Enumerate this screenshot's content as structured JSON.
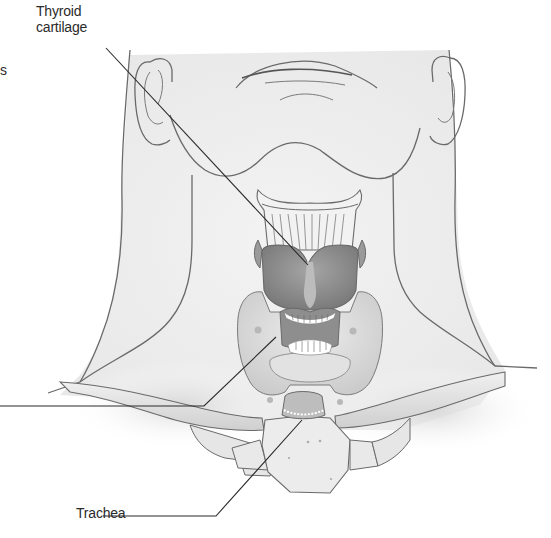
{
  "figure": {
    "labels": {
      "thyroid_cartilage_line1": "Thyroid",
      "thyroid_cartilage_line2": "cartilage",
      "trachea": "Trachea",
      "cropped_left_fragment": "s"
    },
    "leader_lines": [
      {
        "label": "Thyroid cartilage",
        "from": [
          118,
          45
        ],
        "to": [
          308,
          263
        ]
      },
      {
        "label": "(cropped, left edge) thyroid gland",
        "from": [
          0,
          406
        ],
        "to": [
          204,
          406
        ],
        "bend_to": [
          276,
          337
        ]
      },
      {
        "label": "Trachea",
        "from": [
          103,
          516
        ],
        "to": [
          216,
          516
        ],
        "bend_to": [
          300,
          420
        ]
      }
    ],
    "colors": {
      "background": "#ffffff",
      "skin_fill": "#efefef",
      "outline": "#6a6a6a",
      "cartilage_fill": "#8e8e8e",
      "thyroid_fill": "#dcdcdc",
      "bone_fill": "#e3e3e3",
      "leader_line": "#2a2a2a",
      "text": "#2b2b2b"
    }
  }
}
